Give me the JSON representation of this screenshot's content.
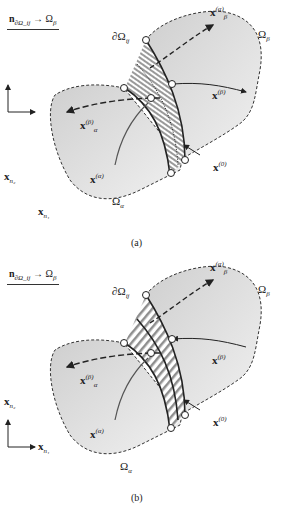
{
  "figure": {
    "colors": {
      "region_fill": "#d6d6d6",
      "band_stripe": "#9a9a9a",
      "outline": "#222222",
      "background": "#ffffff"
    },
    "panels": [
      {
        "id": "a",
        "caption": "(a)",
        "normal_label": {
          "vec": "n",
          "sub": "∂Ω_ij",
          "arrow": "→",
          "target": "Ω",
          "target_sub": "β"
        },
        "domain_alpha": {
          "sym": "Ω",
          "sub": "α"
        },
        "domain_beta": {
          "sym": "Ω",
          "sub": "β"
        },
        "boundary": {
          "sym": "∂Ω",
          "sub": "ij"
        },
        "x_alpha": {
          "vec": "x",
          "sup": "(α)"
        },
        "x_beta": {
          "vec": "x",
          "sup": "(β)"
        },
        "x_alpha_beta": {
          "vec": "x",
          "sub": "α",
          "sup": "(β)"
        },
        "x_beta_alpha": {
          "vec": "x",
          "sub": "β",
          "sup": "(α)"
        },
        "x_zero": {
          "vec": "x",
          "sup": "(0)"
        },
        "axes": {
          "x1": {
            "vec": "x",
            "sub": "n₁"
          },
          "x2": {
            "vec": "x",
            "sub": "n₂"
          }
        },
        "band_style": "striped band with dotted centerline"
      },
      {
        "id": "b",
        "caption": "(b)",
        "normal_label": {
          "vec": "n",
          "sub": "∂Ω_ij",
          "arrow": "→",
          "target": "Ω",
          "target_sub": "β"
        },
        "domain_alpha": {
          "sym": "Ω",
          "sub": "α"
        },
        "domain_beta": {
          "sym": "Ω",
          "sub": "β"
        },
        "boundary": {
          "sym": "∂Ω",
          "sub": "ij"
        },
        "x_alpha": {
          "vec": "x",
          "sup": "(α)"
        },
        "x_beta": {
          "vec": "x",
          "sup": "(β)"
        },
        "x_alpha_beta": {
          "vec": "x",
          "sub": "α",
          "sup": "(β)"
        },
        "x_beta_alpha": {
          "vec": "x",
          "sub": "β",
          "sup": "(α)"
        },
        "x_zero": {
          "vec": "x",
          "sup": "(0)"
        },
        "axes": {
          "x1": {
            "vec": "x",
            "sub": "n₁"
          },
          "x2": {
            "vec": "x",
            "sub": "n₂"
          }
        },
        "band_style": "diagonal hatched band"
      }
    ]
  }
}
